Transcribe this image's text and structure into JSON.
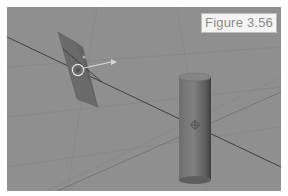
{
  "figure": {
    "label": "Figure 3.56"
  },
  "viewport": {
    "background_color": "#8f8f8f",
    "objects": [
      {
        "name": "Plane",
        "type": "plane",
        "color": "#6a6a6a"
      },
      {
        "name": "Cylinder",
        "type": "cylinder",
        "color": "#7b7b7b"
      }
    ],
    "gizmos": [
      {
        "type": "selection-circle",
        "color": "#e6e6e6"
      },
      {
        "type": "direction-arrow",
        "color": "#d8d8d8"
      },
      {
        "type": "object-origin",
        "color": "#5a5a5a"
      }
    ],
    "axis_line_color": "#3e3e3e",
    "grid_line_color": "#828282"
  }
}
